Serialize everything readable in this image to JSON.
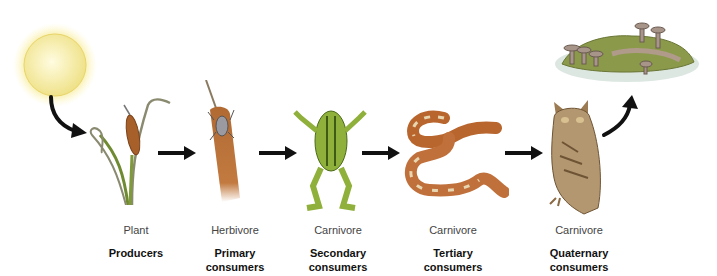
{
  "diagram": {
    "type": "food-chain",
    "energy_source": "sun",
    "decomposer": "fungi-on-decaying-animal",
    "stages": [
      {
        "organism": "cattail-plant",
        "role": "Plant",
        "level": "Producers",
        "level_line2": ""
      },
      {
        "organism": "grasshopper",
        "role": "Herbivore",
        "level": "Primary",
        "level_line2": "consumers"
      },
      {
        "organism": "frog",
        "role": "Carnivore",
        "level": "Secondary",
        "level_line2": "consumers"
      },
      {
        "organism": "snake",
        "role": "Carnivore",
        "level": "Tertiary",
        "level_line2": "consumers"
      },
      {
        "organism": "owl",
        "role": "Carnivore",
        "level": "Quaternary",
        "level_line2": "consumers"
      }
    ],
    "colors": {
      "arrow": "#111111",
      "sun": "#f6ec9a",
      "plant_green": "#7f9a3a",
      "cattail_brown": "#a8602a",
      "frog_green": "#8fb03a",
      "snake_orange": "#b8662e",
      "owl_brown": "#9c7a52",
      "moss_green": "#8a9a4a"
    }
  }
}
